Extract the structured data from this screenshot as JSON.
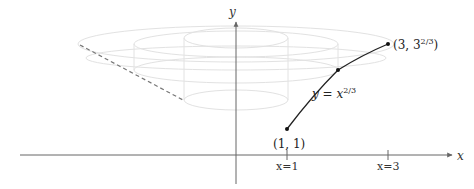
{
  "diagram": {
    "axes": {
      "x_label": "x",
      "y_label": "y",
      "ticks": [
        {
          "label": "x=1",
          "value": 1
        },
        {
          "label": "x=3",
          "value": 3
        }
      ]
    },
    "curve": {
      "label_prefix": "y = x",
      "label_exponent": "2/3",
      "start_point": {
        "label_text": "(1, 1)",
        "x": 1,
        "y": 1
      },
      "end_point": {
        "label_base": "(3, 3",
        "label_exponent": "2/3",
        "label_close": ")",
        "x": 3,
        "y": 2.08
      },
      "mid_point": {
        "x": 2,
        "y": 1.59
      }
    },
    "colors": {
      "axis": "#555555",
      "curve": "#222222",
      "surface": "#e4e4e4",
      "dashed": "#777777",
      "text": "#222222"
    }
  }
}
